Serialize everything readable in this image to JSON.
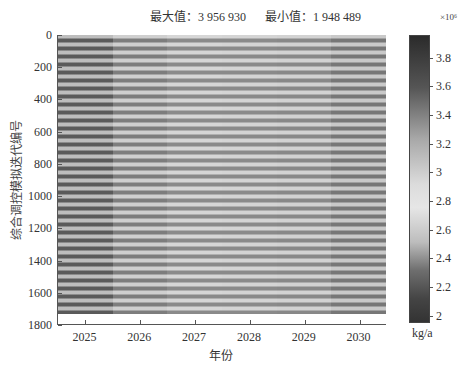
{
  "chart_data": {
    "type": "heatmap",
    "title": "",
    "annotations": [
      {
        "label": "最大值：",
        "value": "3 956 930"
      },
      {
        "label": "最小值：",
        "value": "1 948 489"
      }
    ],
    "xlabel": "年份",
    "ylabel": "综合调控模拟迭代编号",
    "x_categories": [
      "2025",
      "2026",
      "2027",
      "2028",
      "2029",
      "2030"
    ],
    "y_ticks": [
      "0",
      "200",
      "400",
      "600",
      "800",
      "1000",
      "1200",
      "1400",
      "1600",
      "1800"
    ],
    "ylim": [
      0,
      1800
    ],
    "y_data_extent": [
      0,
      1740
    ],
    "colorbar": {
      "label": "kg/a",
      "exponent": "×10⁶",
      "ticks": [
        "3.8",
        "3.6",
        "3.4",
        "3.2",
        "3",
        "2.8",
        "2.6",
        "2.4",
        "2.2",
        "2"
      ],
      "range": [
        1.948489,
        3.95693
      ],
      "colormap": "grayscale (dark = high, light = mid, dark = low)"
    },
    "column_mean_shade": {
      "2025": "darker, high contrast stripes",
      "2026": "lighter stripes",
      "2027": "light, fine stripes",
      "2028": "light, fine stripes",
      "2029": "light, fine stripes",
      "2030": "slightly darker stripes"
    },
    "stripe_period_px": 8
  },
  "texts": {
    "max_annot": "最大值：3 956 930",
    "min_annot": "最小值：1 948 489",
    "xtitle": "年份",
    "ytitle": "综合调控模拟迭代编号",
    "cb_exp": "×10⁶",
    "cb_unit": "kg/a"
  }
}
